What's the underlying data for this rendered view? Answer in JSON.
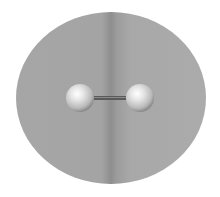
{
  "diagram": {
    "type": "molecule",
    "colors": {
      "background": "#ffffff",
      "cloud": "#a8a8a8",
      "cloud_dark_stripe": "#8c8c8c",
      "atom_highlight": "#ffffff",
      "atom_base": "#c8c8c8",
      "atom_shadow": "#8a8a8a",
      "bond": "#5a5a5a"
    },
    "cloud": {
      "cx": 111,
      "cy": 98,
      "rx": 95,
      "ry": 86
    },
    "atoms": [
      {
        "id": "atom-left",
        "cx": 80,
        "cy": 98,
        "r": 14
      },
      {
        "id": "atom-right",
        "cx": 140,
        "cy": 98,
        "r": 14
      }
    ],
    "bond": {
      "x1": 94,
      "x2": 126,
      "y": 98,
      "thickness": 4
    }
  }
}
